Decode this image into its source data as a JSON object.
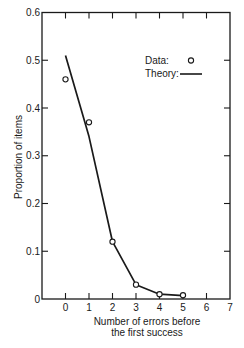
{
  "chart_data": {
    "type": "line",
    "title": "",
    "xlabel": "Number of errors before the first success",
    "xlabel_lines": [
      "Number of errors before",
      "the first success"
    ],
    "ylabel": "Proportion of items",
    "xlim": [
      -1,
      7
    ],
    "ylim": [
      0,
      0.6
    ],
    "x_ticks": [
      0,
      1,
      2,
      3,
      4,
      5,
      6,
      7
    ],
    "x_tick_labels": [
      "0",
      "1",
      "2",
      "3",
      "4",
      "5",
      "6",
      "7"
    ],
    "y_ticks": [
      0,
      0.1,
      0.2,
      0.3,
      0.4,
      0.5,
      0.6
    ],
    "y_tick_labels": [
      "0",
      "0.1",
      "0.2",
      "0.3",
      "0.4",
      "0.5",
      "0.6"
    ],
    "grid": false,
    "legend_position": "upper right",
    "series": [
      {
        "name": "Data",
        "legend_label": "Data:",
        "style": "open-circle-markers",
        "x": [
          0,
          1,
          2,
          3,
          4,
          5
        ],
        "values": [
          0.46,
          0.37,
          0.12,
          0.03,
          0.01,
          0.008
        ]
      },
      {
        "name": "Theory",
        "legend_label": "Theory:",
        "style": "solid-line",
        "x": [
          0,
          1,
          2,
          3,
          4,
          5
        ],
        "values": [
          0.51,
          0.34,
          0.12,
          0.03,
          0.01,
          0.007
        ]
      }
    ]
  },
  "colors": {
    "ink": "#1a1a1a",
    "background": "#ffffff"
  }
}
